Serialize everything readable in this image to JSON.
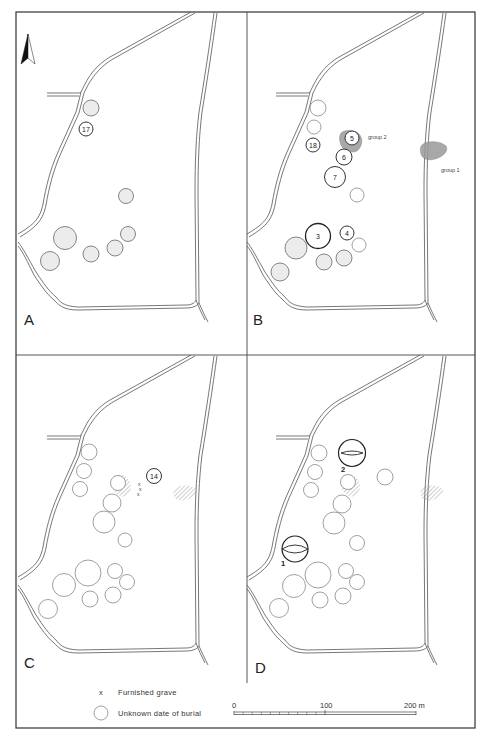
{
  "figure": {
    "header_text_partial": "",
    "frame": {
      "x": 16,
      "y": 12,
      "width": 459,
      "height": 716
    },
    "dividers": {
      "vertical_x": 247,
      "vertical_y_end": 683,
      "horizontal_y": 355
    }
  },
  "panels": [
    {
      "id": "A",
      "letter": "A",
      "origin": [
        18,
        12
      ],
      "letter_pos": [
        6,
        313
      ],
      "show_north_arrow": true,
      "mounds": [
        {
          "cx": 73,
          "cy": 96,
          "r": 8,
          "style": "shaded"
        },
        {
          "cx": 68,
          "cy": 117,
          "r": 7,
          "style": "numbered",
          "label": "17"
        },
        {
          "cx": 108,
          "cy": 184,
          "r": 7.5,
          "style": "shaded"
        },
        {
          "cx": 47,
          "cy": 226,
          "r": 11.5,
          "style": "shaded"
        },
        {
          "cx": 32,
          "cy": 249,
          "r": 9.5,
          "style": "shaded"
        },
        {
          "cx": 73,
          "cy": 242,
          "r": 8,
          "style": "shaded"
        },
        {
          "cx": 97,
          "cy": 236,
          "r": 8,
          "style": "shaded"
        },
        {
          "cx": 110,
          "cy": 222,
          "r": 7.5,
          "style": "shaded"
        }
      ],
      "patches": [],
      "labels": []
    },
    {
      "id": "B",
      "letter": "B",
      "origin": [
        247,
        12
      ],
      "letter_pos": [
        6,
        313
      ],
      "show_north_arrow": false,
      "mounds": [
        {
          "cx": 71,
          "cy": 96,
          "r": 8,
          "style": "open"
        },
        {
          "cx": 67,
          "cy": 115,
          "r": 7,
          "style": "open"
        },
        {
          "cx": 66,
          "cy": 133,
          "r": 7,
          "style": "numbered",
          "label": "18"
        },
        {
          "cx": 105,
          "cy": 126,
          "r": 7,
          "style": "numbered",
          "label": "5"
        },
        {
          "cx": 97,
          "cy": 145,
          "r": 8,
          "style": "numbered",
          "label": "6"
        },
        {
          "cx": 88,
          "cy": 165,
          "r": 10.5,
          "style": "numbered",
          "label": "7"
        },
        {
          "cx": 110,
          "cy": 183,
          "r": 7,
          "style": "open"
        },
        {
          "cx": 71,
          "cy": 224,
          "r": 12.5,
          "style": "bold",
          "label": "3"
        },
        {
          "cx": 100,
          "cy": 221,
          "r": 7,
          "style": "numbered",
          "label": "4"
        },
        {
          "cx": 112,
          "cy": 233,
          "r": 7,
          "style": "open"
        },
        {
          "cx": 49,
          "cy": 236,
          "r": 11,
          "style": "shaded"
        },
        {
          "cx": 33,
          "cy": 260,
          "r": 9,
          "style": "shaded"
        },
        {
          "cx": 77,
          "cy": 250,
          "r": 8,
          "style": "shaded"
        },
        {
          "cx": 97,
          "cy": 246,
          "r": 8,
          "style": "shaded"
        }
      ],
      "patches": [
        {
          "type": "group",
          "d": "M94,121 C98,117 108,118 112,122 C116,126 116,134 110,139 C104,142 96,138 94,133 C92,128 92,124 94,121 Z"
        },
        {
          "type": "group",
          "d": "M175,133 C180,128 194,129 199,134 C202,139 196,145 188,147 C182,149 175,147 174,142 C173,138 173,135 175,133 Z"
        }
      ],
      "labels": [
        {
          "text": "group 2",
          "x": 121,
          "y": 127
        },
        {
          "text": "group 1",
          "x": 194,
          "y": 160
        }
      ]
    },
    {
      "id": "C",
      "letter": "C",
      "origin": [
        18,
        355
      ],
      "letter_pos": [
        6,
        313
      ],
      "show_north_arrow": false,
      "mounds": [
        {
          "cx": 71,
          "cy": 97,
          "r": 8,
          "style": "open"
        },
        {
          "cx": 66,
          "cy": 116,
          "r": 7.5,
          "style": "open"
        },
        {
          "cx": 62,
          "cy": 134,
          "r": 7.5,
          "style": "open"
        },
        {
          "cx": 100,
          "cy": 128,
          "r": 7.5,
          "style": "open"
        },
        {
          "cx": 136,
          "cy": 121,
          "r": 7.5,
          "style": "numbered",
          "label": "14"
        },
        {
          "cx": 94,
          "cy": 148,
          "r": 9,
          "style": "open"
        },
        {
          "cx": 86,
          "cy": 167,
          "r": 11,
          "style": "open"
        },
        {
          "cx": 107,
          "cy": 185,
          "r": 7,
          "style": "open"
        },
        {
          "cx": 70,
          "cy": 218,
          "r": 13,
          "style": "open"
        },
        {
          "cx": 97,
          "cy": 216,
          "r": 7.5,
          "style": "open"
        },
        {
          "cx": 109,
          "cy": 227,
          "r": 7.5,
          "style": "open"
        },
        {
          "cx": 46,
          "cy": 230,
          "r": 11.5,
          "style": "open"
        },
        {
          "cx": 30,
          "cy": 254,
          "r": 9.5,
          "style": "open"
        },
        {
          "cx": 72,
          "cy": 244,
          "r": 8,
          "style": "open"
        },
        {
          "cx": 95,
          "cy": 240,
          "r": 8,
          "style": "open"
        }
      ],
      "patches": [
        {
          "type": "hatch",
          "d": "M96,121 C100,118 108,120 111,125 C114,130 114,137 108,141 C102,143 97,139 95,134 C93,129 94,124 96,121 Z"
        },
        {
          "type": "hatch",
          "d": "M157,133 C162,129 174,130 178,134 C180,138 175,143 168,145 C163,147 157,145 156,141 C155,137 155,135 157,133 Z"
        }
      ],
      "furnished_graves": [
        {
          "x": 120,
          "y": 131
        },
        {
          "x": 121,
          "y": 136
        },
        {
          "x": 119,
          "y": 141
        }
      ],
      "labels": []
    },
    {
      "id": "D",
      "letter": "D",
      "origin": [
        247,
        355
      ],
      "letter_pos": [
        8,
        318
      ],
      "show_north_arrow": false,
      "mounds": [
        {
          "cx": 72,
          "cy": 98,
          "r": 8,
          "style": "open"
        },
        {
          "cx": 68,
          "cy": 117,
          "r": 7.5,
          "style": "open"
        },
        {
          "cx": 64,
          "cy": 135,
          "r": 7.5,
          "style": "open"
        },
        {
          "cx": 101,
          "cy": 127,
          "r": 7.5,
          "style": "open"
        },
        {
          "cx": 138,
          "cy": 122,
          "r": 8,
          "style": "open"
        },
        {
          "cx": 95,
          "cy": 149,
          "r": 9,
          "style": "open"
        },
        {
          "cx": 87,
          "cy": 168,
          "r": 11,
          "style": "open"
        },
        {
          "cx": 110,
          "cy": 188,
          "r": 7.5,
          "style": "open"
        },
        {
          "cx": 71,
          "cy": 220,
          "r": 13,
          "style": "open"
        },
        {
          "cx": 99,
          "cy": 216,
          "r": 7.5,
          "style": "open"
        },
        {
          "cx": 110,
          "cy": 227,
          "r": 7.5,
          "style": "open"
        },
        {
          "cx": 47,
          "cy": 231,
          "r": 11.5,
          "style": "open"
        },
        {
          "cx": 32,
          "cy": 253,
          "r": 9.5,
          "style": "open"
        },
        {
          "cx": 73,
          "cy": 245,
          "r": 8,
          "style": "open"
        },
        {
          "cx": 96,
          "cy": 241,
          "r": 8,
          "style": "open"
        }
      ],
      "lens_mounds": [
        {
          "cx": 105,
          "cy": 98,
          "r": 13.5,
          "label": "2",
          "label_x": 96,
          "label_y": 114,
          "lens_rx": 11,
          "lens_ry": 2
        },
        {
          "cx": 48,
          "cy": 194,
          "r": 13,
          "label": "1",
          "label_x": 36,
          "label_y": 208,
          "lens_rx": 13,
          "lens_ry": 4
        }
      ],
      "patches": [
        {
          "type": "hatch",
          "d": "M96,121 C100,118 108,120 111,125 C114,130 114,137 108,141 C102,143 97,139 95,134 C93,129 94,124 96,121 Z"
        },
        {
          "type": "hatch",
          "d": "M175,133 C180,129 192,130 196,134 C198,138 193,143 186,145 C181,147 175,145 174,141 C173,137 173,135 175,133 Z"
        }
      ],
      "labels": []
    }
  ],
  "legend": {
    "furnished_grave": {
      "symbol": "x",
      "label": "Furnished grave"
    },
    "unknown_date": {
      "symbol": "circle",
      "label": "Unknown date of burial"
    }
  },
  "scale_bar": {
    "x_start": 234,
    "x_end": 416,
    "y": 712,
    "labels": [
      {
        "text": "0",
        "value": 0
      },
      {
        "text": "100",
        "value": 100
      },
      {
        "text": "200 m",
        "value": 200
      }
    ],
    "unit": "m",
    "minor_ticks": 10
  },
  "colors": {
    "line": "#555555",
    "frame": "#333333",
    "mound_shaded_fill": "#ececec",
    "group_fill": "#999999",
    "hatch": "#888888"
  }
}
